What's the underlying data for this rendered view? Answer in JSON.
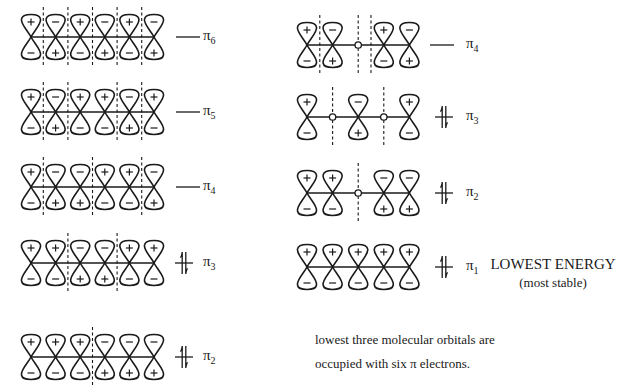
{
  "left_column": {
    "orbitals_count": 6,
    "levels": [
      {
        "name": "pi6",
        "label": "π",
        "subscript": "6",
        "y": 37,
        "phases": [
          "+",
          "-",
          "+",
          "-",
          "+",
          "-"
        ],
        "nodes_between": [
          1,
          2,
          3,
          4,
          5
        ],
        "occupied": false
      },
      {
        "name": "pi5",
        "label": "π",
        "subscript": "5",
        "y": 112,
        "phases": [
          "+",
          "-",
          "+",
          "+",
          "-",
          "+"
        ],
        "nodes_between": [
          1,
          2,
          4,
          5
        ],
        "occupied": false
      },
      {
        "name": "pi4",
        "label": "π",
        "subscript": "4",
        "y": 187,
        "phases": [
          "+",
          "-",
          "-",
          "+",
          "+",
          "-"
        ],
        "nodes_between": [
          1,
          3,
          5
        ],
        "occupied": false
      },
      {
        "name": "pi3",
        "label": "π",
        "subscript": "3",
        "y": 263,
        "phases": [
          "+",
          "+",
          "-",
          "-",
          "+",
          "+"
        ],
        "nodes_between": [
          2,
          4
        ],
        "occupied": true
      },
      {
        "name": "pi2",
        "label": "π",
        "subscript": "2",
        "y": 357,
        "phases": [
          "+",
          "+",
          "+",
          "-",
          "-",
          "-"
        ],
        "nodes_between": [
          3
        ],
        "occupied": true
      }
    ]
  },
  "right_column": {
    "orbitals_count": 5,
    "levels": [
      {
        "name": "pi4",
        "label": "π",
        "subscript": "4",
        "y": 45,
        "phases": [
          "+",
          "-",
          null,
          "+",
          "-"
        ],
        "nodes_between": [
          1,
          3
        ],
        "node_on_atom": [
          2
        ],
        "occupied": false
      },
      {
        "name": "pi3",
        "label": "π",
        "subscript": "3",
        "y": 117,
        "phases": [
          "+",
          null,
          "-",
          null,
          "+"
        ],
        "nodes_between": [],
        "node_on_atom": [
          1,
          3
        ],
        "occupied": true
      },
      {
        "name": "pi2",
        "label": "π",
        "subscript": "2",
        "y": 193,
        "phases": [
          "+",
          "+",
          null,
          "-",
          "-"
        ],
        "nodes_between": [],
        "node_on_atom": [
          2
        ],
        "occupied": true
      },
      {
        "name": "pi1",
        "label": "π",
        "subscript": "1",
        "y": 267,
        "phases": [
          "+",
          "+",
          "+",
          "+",
          "+"
        ],
        "nodes_between": [],
        "node_on_atom": [],
        "occupied": true
      }
    ]
  },
  "annotations": {
    "lowest_title": "LOWEST ENERGY",
    "lowest_sub": "(most stable)",
    "footnote_line1": "lowest three molecular orbitals are",
    "footnote_line2": "occupied with six π electrons."
  },
  "colors": {
    "ink": "#1a1a1a",
    "background": "#ffffff"
  }
}
